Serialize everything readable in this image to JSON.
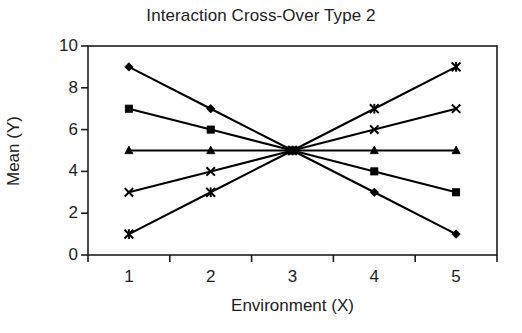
{
  "chart_data": {
    "type": "line",
    "title": "Interaction Cross-Over Type 2",
    "xlabel": "Environment (X)",
    "ylabel": "Mean (Y)",
    "categories": [
      "1",
      "2",
      "3",
      "4",
      "5"
    ],
    "x": [
      1,
      2,
      3,
      4,
      5
    ],
    "ylim": [
      0,
      10
    ],
    "yticks": [
      0,
      2,
      4,
      6,
      8,
      10
    ],
    "ytick_labels": [
      "0",
      "2",
      "4",
      "6",
      "8",
      "10"
    ],
    "xtick_labels": [
      "1",
      "2",
      "3",
      "4",
      "5"
    ],
    "grid": false,
    "legend": "none",
    "line_color": "#000000",
    "series": [
      {
        "name": "Series 1",
        "marker": "diamond",
        "values": [
          9,
          7,
          5,
          3,
          1
        ]
      },
      {
        "name": "Series 2",
        "marker": "square",
        "values": [
          7,
          6,
          5,
          4,
          3
        ]
      },
      {
        "name": "Series 3",
        "marker": "triangle",
        "values": [
          5,
          5,
          5,
          5,
          5
        ]
      },
      {
        "name": "Series 4",
        "marker": "cross",
        "values": [
          3,
          4,
          5,
          6,
          7
        ]
      },
      {
        "name": "Series 5",
        "marker": "star",
        "values": [
          1,
          3,
          5,
          7,
          9
        ]
      }
    ]
  }
}
